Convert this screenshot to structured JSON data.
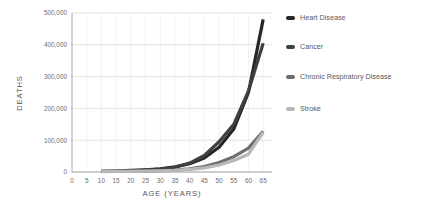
{
  "chart_data": {
    "type": "line",
    "title": "",
    "xlabel": "AGE (YEARS)",
    "ylabel": "DEATHS",
    "xlim": [
      0,
      68
    ],
    "ylim": [
      0,
      500000
    ],
    "grid": true,
    "legend_position": "right",
    "x_ticks": [
      "0",
      "5",
      "10",
      "15",
      "20",
      "25",
      "30",
      "35",
      "40",
      "45",
      "50",
      "55",
      "60",
      "65"
    ],
    "x_tick_values": [
      0,
      5,
      10,
      15,
      20,
      25,
      30,
      35,
      40,
      45,
      50,
      55,
      60,
      65
    ],
    "y_ticks": [
      "0",
      "100,000",
      "200,000",
      "300,000",
      "400,000",
      "500,000"
    ],
    "y_tick_values": [
      0,
      100000,
      200000,
      300000,
      400000,
      500000
    ],
    "x": [
      10,
      15,
      20,
      25,
      30,
      35,
      40,
      45,
      50,
      55,
      60,
      65
    ],
    "series": [
      {
        "name": "Heart Disease",
        "color": "#262626",
        "values": [
          2000,
          3000,
          5000,
          7000,
          10000,
          16000,
          26000,
          44000,
          78000,
          135000,
          250000,
          480000
        ]
      },
      {
        "name": "Cancer",
        "color": "#3f3f3f",
        "values": [
          2000,
          3000,
          4000,
          6000,
          9000,
          15000,
          28000,
          52000,
          95000,
          150000,
          255000,
          405000
        ]
      },
      {
        "name": "Chronic Respiratory Disease",
        "color": "#6e6e6e",
        "values": [
          1500,
          2000,
          2500,
          3000,
          4000,
          6000,
          10000,
          17000,
          30000,
          48000,
          75000,
          128000
        ]
      },
      {
        "name": "Stroke",
        "color": "#b8b8b8",
        "values": [
          1200,
          1800,
          2200,
          2800,
          3500,
          5000,
          8000,
          13000,
          22000,
          36000,
          56000,
          125000
        ]
      }
    ]
  },
  "axis": {
    "y_title": "DEATHS",
    "x_title": "AGE (YEARS)"
  },
  "legend": {
    "items": [
      {
        "label": "Heart Disease",
        "color": "#262626"
      },
      {
        "label": "Cancer",
        "color": "#3f3f3f"
      },
      {
        "label": "Chronic Respiratory Disease",
        "color": "#6e6e6e"
      },
      {
        "label": "Stroke",
        "color": "#b8b8b8"
      }
    ]
  },
  "colors": {
    "background": "#ffffff",
    "gridline": "#d4d4d4",
    "vertical_gridline": "#ededed",
    "axis": "#a8a8a8",
    "tick_text": "#6e6e6e",
    "title_text": "#595959"
  }
}
